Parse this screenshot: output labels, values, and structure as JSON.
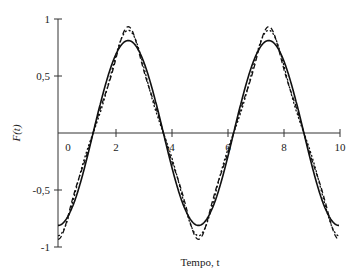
{
  "chart_data": {
    "type": "line",
    "title": "",
    "xlabel": "Tempo, t",
    "ylabel": "F(t)",
    "xlim": [
      0,
      10
    ],
    "ylim": [
      -1,
      1
    ],
    "x_ticks": [
      "0",
      "2",
      "4",
      "6",
      "8",
      "10"
    ],
    "y_ticks": [
      "1",
      "0,5",
      "-0,5",
      "-1"
    ],
    "grid": false,
    "legend": null,
    "period": 5,
    "series": [
      {
        "name": "1 termo",
        "style": "solid",
        "terms": 1,
        "x": [
          0,
          1.25,
          2.5,
          3.75,
          5,
          6.25,
          7.5,
          8.75,
          10
        ],
        "values": [
          -0.81,
          0,
          0.81,
          0,
          -0.81,
          0,
          0.81,
          0,
          -0.81
        ]
      },
      {
        "name": "2 termos",
        "style": "dotted",
        "terms": 2,
        "x": [
          0,
          1.25,
          2.5,
          3.75,
          5,
          6.25,
          7.5,
          8.75,
          10
        ],
        "values": [
          -0.9,
          0,
          0.9,
          0,
          -0.9,
          0,
          0.9,
          0,
          -0.9
        ]
      },
      {
        "name": "3 termos",
        "style": "dashed",
        "terms": 3,
        "x": [
          0,
          1.25,
          2.5,
          3.75,
          5,
          6.25,
          7.5,
          8.75,
          10
        ],
        "values": [
          -0.93,
          0,
          0.93,
          0,
          -0.93,
          0,
          0.93,
          0,
          -0.93
        ]
      }
    ]
  }
}
